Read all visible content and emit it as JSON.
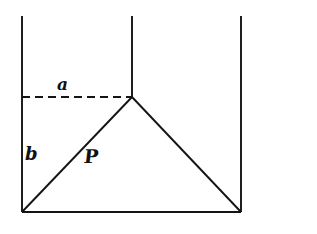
{
  "figure": {
    "kind": "geometry-diagram",
    "background_color": "#ffffff",
    "stroke_color": "#141414",
    "canvas": {
      "width": 317,
      "height": 234
    }
  },
  "labels": {
    "a": "a",
    "b": "b",
    "p": "P"
  },
  "geometry": {
    "vertical_lines": [
      {
        "name": "left-wall",
        "x": 22,
        "y_top": 16,
        "y_bottom": 212
      },
      {
        "name": "middle-wall",
        "x": 132,
        "y_top": 16,
        "y_bottom": 97
      },
      {
        "name": "right-wall",
        "x": 241,
        "y_top": 16,
        "y_bottom": 212
      }
    ],
    "baseline": {
      "name": "base",
      "x1": 22,
      "y1": 212,
      "x2": 241,
      "y2": 212
    },
    "dashed_segment": {
      "name": "segment-a",
      "x1": 22,
      "y1": 97,
      "x2": 132,
      "y2": 97
    },
    "triangle": {
      "apex": {
        "x": 132,
        "y": 97
      },
      "bottom_left": {
        "x": 22,
        "y": 212
      },
      "bottom_right": {
        "x": 241,
        "y": 212
      }
    },
    "left_diagonal": {
      "name": "segment-p",
      "x1": 22,
      "y1": 212,
      "x2": 132,
      "y2": 97
    },
    "right_diagonal": {
      "name": "right-slope",
      "x1": 132,
      "y1": 97,
      "x2": 241,
      "y2": 212
    },
    "vertical_label_b": {
      "name": "segment-b",
      "x": 22,
      "y1": 97,
      "y2": 212
    }
  },
  "label_positions": {
    "a": {
      "x": 66,
      "y": 86
    },
    "b": {
      "x": 31,
      "y": 155
    },
    "p": {
      "x": 90,
      "y": 159
    }
  }
}
